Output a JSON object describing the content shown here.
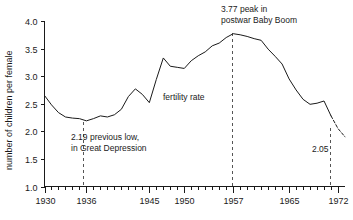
{
  "chart_data": {
    "type": "line",
    "title": "",
    "xlabel": "",
    "ylabel": "number of children per female",
    "series_label": "fertility rate",
    "xlim": [
      1930,
      1973
    ],
    "ylim": [
      1.0,
      4.0
    ],
    "grid": false,
    "legend": "none",
    "y_ticks": [
      "1.0",
      "1.5",
      "2.0",
      "2.5",
      "3.0",
      "3.5",
      "4.0"
    ],
    "y_tick_values": [
      1.0,
      1.5,
      2.0,
      2.5,
      3.0,
      3.5,
      4.0
    ],
    "x_ticks": [
      "1930",
      "1936",
      "1945",
      "1950",
      "1957",
      "1965",
      "1972"
    ],
    "x_tick_values": [
      1930,
      1936,
      1945,
      1950,
      1957,
      1965,
      1972
    ],
    "x_minor_interval": 1,
    "x": [
      1930,
      1931,
      1932,
      1933,
      1934,
      1935,
      1936,
      1937,
      1938,
      1939,
      1940,
      1941,
      1942,
      1943,
      1944,
      1945,
      1946,
      1947,
      1948,
      1949,
      1950,
      1951,
      1952,
      1953,
      1954,
      1955,
      1956,
      1957,
      1958,
      1959,
      1960,
      1961,
      1962,
      1963,
      1964,
      1965,
      1966,
      1967,
      1968,
      1969,
      1970,
      1971,
      1972,
      1973
    ],
    "values": [
      2.65,
      2.48,
      2.34,
      2.26,
      2.24,
      2.23,
      2.19,
      2.23,
      2.28,
      2.26,
      2.3,
      2.4,
      2.63,
      2.77,
      2.67,
      2.52,
      2.94,
      3.33,
      3.18,
      3.16,
      3.14,
      3.28,
      3.37,
      3.44,
      3.55,
      3.6,
      3.7,
      3.77,
      3.75,
      3.72,
      3.68,
      3.65,
      3.49,
      3.36,
      3.22,
      2.95,
      2.75,
      2.58,
      2.49,
      2.51,
      2.55,
      2.28,
      2.05,
      1.9
    ],
    "dashed_from": 1971,
    "annotations": [
      {
        "name": "peak-annotation",
        "lines": [
          "3.77 peak in",
          "postwar Baby Boom"
        ],
        "value": 3.77,
        "year": 1957
      },
      {
        "name": "low-annotation",
        "lines": [
          "2.19 previous low,",
          "in Great Depression"
        ],
        "value": 2.19,
        "year": 1936
      },
      {
        "name": "final-annotation",
        "lines": [
          "2.05"
        ],
        "value": 2.05,
        "year": 1972
      }
    ],
    "colors": {
      "line": "#1a1a1a",
      "axis": "#1a1a1a",
      "leader": "#555555",
      "background": "#ffffff"
    }
  }
}
